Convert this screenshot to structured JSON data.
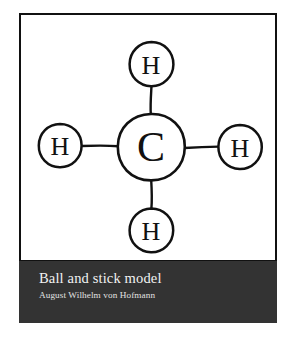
{
  "figure": {
    "kind": "hand-drawn-chemical-structure",
    "molecule": "methane",
    "background_color": "#ffffff",
    "ink_color": "#111111",
    "frame_color": "#111111",
    "atoms": [
      {
        "id": "carbon-center",
        "symbol": "C",
        "cx": 130,
        "cy": 132,
        "r": 33,
        "label_size": 34
      },
      {
        "id": "hydrogen-top",
        "symbol": "H",
        "cx": 130,
        "cy": 49,
        "r": 22,
        "label_size": 23
      },
      {
        "id": "hydrogen-left",
        "symbol": "H",
        "cx": 39,
        "cy": 130,
        "r": 21,
        "label_size": 23
      },
      {
        "id": "hydrogen-right",
        "symbol": "H",
        "cx": 219,
        "cy": 132,
        "r": 22,
        "label_size": 23
      },
      {
        "id": "hydrogen-bottom",
        "symbol": "H",
        "cx": 130,
        "cy": 215,
        "r": 22,
        "label_size": 23
      }
    ],
    "bonds": [
      {
        "id": "bond-c-h-top",
        "from": "carbon-center",
        "to": "hydrogen-top"
      },
      {
        "id": "bond-c-h-left",
        "from": "carbon-center",
        "to": "hydrogen-left"
      },
      {
        "id": "bond-c-h-right",
        "from": "carbon-center",
        "to": "hydrogen-right"
      },
      {
        "id": "bond-c-h-bottom",
        "from": "carbon-center",
        "to": "hydrogen-bottom"
      }
    ]
  },
  "caption": {
    "background_color": "#333333",
    "title": "Ball and stick model",
    "subtitle": "August Wilhelm von Hofmann"
  }
}
